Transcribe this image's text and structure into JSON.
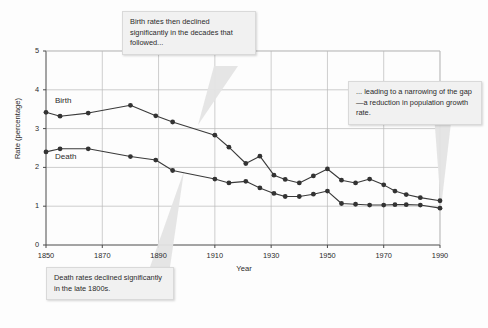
{
  "figure": {
    "background_color": "#fdfdfd",
    "plot_area": {
      "left": 46,
      "top": 51,
      "right": 440,
      "bottom": 245
    }
  },
  "axes": {
    "y_title": "Rate (percentage)",
    "x_title": "Year",
    "y_ticks": [
      "0",
      "1",
      "2",
      "3",
      "4",
      "5"
    ],
    "x_ticks": [
      "1850",
      "1870",
      "1890",
      "1910",
      "1930",
      "1950",
      "1970",
      "1990"
    ]
  },
  "series_labels": {
    "birth": "Birth",
    "death": "Death"
  },
  "callouts": {
    "birth": "Birth rates then declined significantly in the decades that followed...",
    "gap": "... leading to a narrowing of the gap—a reduction in population growth rate.",
    "death": "Death rates declined significantly in the late 1800s."
  },
  "colors": {
    "line": "#3a3a3a",
    "marker": "#333333",
    "grid": "#b9b9b9",
    "axis": "#4a4a4a",
    "callout_fill": "#f1f1f1",
    "callout_border": "#d9d9d9",
    "callout_tail": "#e4e4e4"
  },
  "chart_data": {
    "type": "line",
    "title": "",
    "xlabel": "Year",
    "ylabel": "Rate (percentage)",
    "xlim": [
      1850,
      1990
    ],
    "ylim": [
      0,
      5
    ],
    "xticks": [
      1850,
      1870,
      1890,
      1910,
      1930,
      1950,
      1970,
      1990
    ],
    "yticks": [
      0,
      1,
      2,
      3,
      4,
      5
    ],
    "grid": true,
    "legend_position": "inline-labels",
    "annotations": [
      "Birth rates then declined significantly in the decades that followed...",
      "... leading to a narrowing of the gap—a reduction in population growth rate.",
      "Death rates declined significantly in the late 1800s."
    ],
    "series": [
      {
        "name": "Birth",
        "x": [
          1850,
          1855,
          1865,
          1880,
          1889,
          1895,
          1910,
          1915,
          1921,
          1926,
          1931,
          1935,
          1940,
          1945,
          1950,
          1955,
          1960,
          1965,
          1970,
          1974,
          1978,
          1983,
          1990
        ],
        "values": [
          3.42,
          3.32,
          3.4,
          3.6,
          3.33,
          3.17,
          2.83,
          2.52,
          2.1,
          2.29,
          1.8,
          1.69,
          1.6,
          1.78,
          1.96,
          1.67,
          1.6,
          1.7,
          1.55,
          1.39,
          1.3,
          1.22,
          1.14
        ]
      },
      {
        "name": "Death",
        "x": [
          1850,
          1855,
          1865,
          1880,
          1889,
          1895,
          1910,
          1915,
          1921,
          1926,
          1931,
          1935,
          1940,
          1945,
          1950,
          1955,
          1960,
          1965,
          1970,
          1974,
          1978,
          1983,
          1990
        ],
        "values": [
          2.4,
          2.48,
          2.48,
          2.28,
          2.19,
          1.92,
          1.7,
          1.6,
          1.64,
          1.47,
          1.33,
          1.25,
          1.25,
          1.31,
          1.39,
          1.07,
          1.05,
          1.03,
          1.03,
          1.04,
          1.04,
          1.03,
          0.95
        ]
      }
    ]
  }
}
